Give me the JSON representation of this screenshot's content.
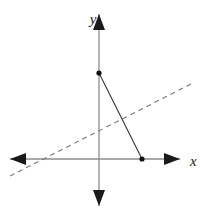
{
  "figure": {
    "width": 204,
    "height": 216,
    "background_color": "#ffffff"
  },
  "axes": {
    "x_axis": {
      "label": "x",
      "label_x": 190,
      "label_y": 166,
      "color": "#8c8c8c",
      "stroke_width": 1.3,
      "y": 159,
      "x_start": 10,
      "x_end": 180,
      "arrow_left": true,
      "arrow_right": true,
      "arrow_color": "#1a1a1a"
    },
    "y_axis": {
      "label": "y",
      "label_x": 93,
      "label_y": 24,
      "color": "#8c8c8c",
      "stroke_width": 1.3,
      "x": 99,
      "y_start": 14,
      "y_end": 206,
      "arrow_up": true,
      "arrow_down": true,
      "arrow_color": "#1a1a1a"
    },
    "origin": {
      "x": 99,
      "y": 159
    }
  },
  "solid_line": {
    "name": "solid-segment",
    "color": "#3a3a3a",
    "stroke_width": 1.1,
    "x1": 99,
    "y1": 73,
    "x2": 142,
    "y2": 159
  },
  "dashed_line": {
    "name": "dashed-line",
    "color": "#777777",
    "stroke_width": 1.1,
    "dash_pattern": "5 4",
    "x1": 10,
    "y1": 176,
    "x2": 191,
    "y2": 84,
    "y_intercept_pixel_y": 126,
    "x_intercept_pixel_x": 35
  },
  "points": [
    {
      "name": "point-on-y-axis",
      "x": 99,
      "y": 73,
      "radius": 2.6,
      "color": "#111111"
    },
    {
      "name": "point-on-x-axis",
      "x": 142,
      "y": 159,
      "radius": 2.6,
      "color": "#111111"
    }
  ],
  "chart_data": {
    "type": "line",
    "title": "",
    "xlabel": "x",
    "ylabel": "y",
    "grid": false,
    "legend": "none",
    "series": [
      {
        "name": "solid segment",
        "style": "solid",
        "points": [
          {
            "px": 99,
            "py": 73
          },
          {
            "px": 142,
            "py": 159
          }
        ]
      },
      {
        "name": "dashed line",
        "style": "dashed",
        "points": [
          {
            "px": 10,
            "py": 176
          },
          {
            "px": 191,
            "py": 84
          }
        ]
      }
    ],
    "marked_points": [
      {
        "px": 99,
        "py": 73,
        "on": "y-axis"
      },
      {
        "px": 142,
        "py": 159,
        "on": "x-axis"
      }
    ]
  }
}
